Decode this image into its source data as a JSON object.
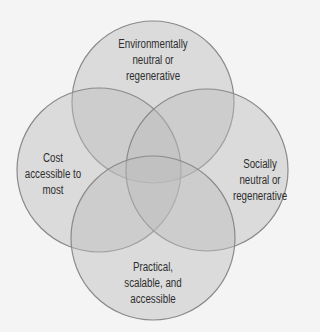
{
  "diagram": {
    "type": "venn",
    "colors": {
      "background": "#f4f4f4",
      "fill": "#bcbcbc",
      "fill_opacity": 0.45,
      "stroke": "#8a8a8a",
      "text": "#2e2e2e"
    },
    "circles": [
      {
        "id": "top",
        "lines": [
          "Environmentally",
          "neutral or",
          "regenerative"
        ]
      },
      {
        "id": "left",
        "lines": [
          "Cost",
          "accessible to",
          "most"
        ]
      },
      {
        "id": "right",
        "lines": [
          "Socially",
          "neutral or",
          "regenerative"
        ]
      },
      {
        "id": "bottom",
        "lines": [
          "Practical,",
          "scalable, and",
          "accessible"
        ]
      }
    ]
  }
}
